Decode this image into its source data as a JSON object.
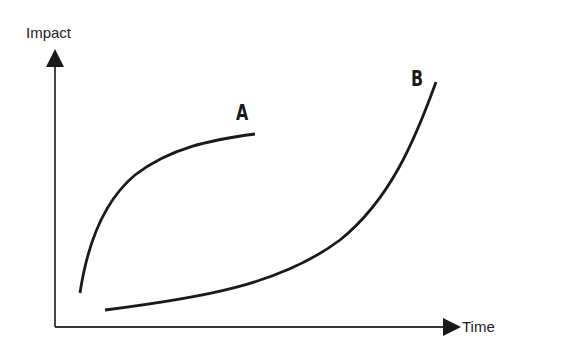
{
  "diagram": {
    "y_axis_label": "Impact",
    "x_axis_label": "Time",
    "curves": [
      {
        "label": "A",
        "shape": "concave, fast initial rise then leveling off"
      },
      {
        "label": "B",
        "shape": "convex, slow start then exponential rise"
      }
    ],
    "colors": {
      "line": "#1a1a1a",
      "background": "#ffffff"
    }
  }
}
